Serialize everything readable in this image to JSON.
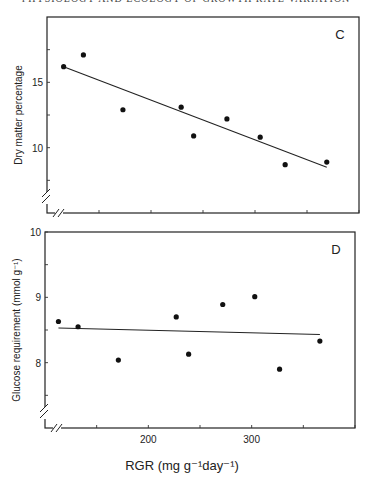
{
  "page": {
    "header": "PHYSIOLOGY AND ECOLOGY OF GROWTH RATE VARIATION"
  },
  "chart_data": [
    {
      "type": "scatter",
      "panel_label": "C",
      "title": "",
      "xlabel": "RGR (mg g⁻¹day⁻¹)",
      "ylabel": "Dry matter percentage",
      "xlim": [
        100,
        400
      ],
      "ylim": [
        5,
        20
      ],
      "axis_break": {
        "x": true,
        "y": true
      },
      "grid": false,
      "x_ticks": [
        150,
        200,
        250,
        300,
        350,
        400
      ],
      "x_tick_labels": [],
      "y_ticks": [
        7.5,
        10,
        12.5,
        15,
        17.5
      ],
      "y_tick_labels": [
        {
          "value": 10,
          "label": "10"
        },
        {
          "value": 15,
          "label": "15"
        }
      ],
      "points": [
        {
          "x": 116,
          "y": 16.2
        },
        {
          "x": 135,
          "y": 17.1
        },
        {
          "x": 173,
          "y": 12.9
        },
        {
          "x": 229,
          "y": 13.1
        },
        {
          "x": 241,
          "y": 10.9
        },
        {
          "x": 273,
          "y": 12.2
        },
        {
          "x": 305,
          "y": 10.8
        },
        {
          "x": 329,
          "y": 8.7
        },
        {
          "x": 369,
          "y": 8.9
        }
      ],
      "fit_line": {
        "x1": 116,
        "y1": 16.2,
        "x2": 369,
        "y2": 8.5
      }
    },
    {
      "type": "scatter",
      "panel_label": "D",
      "title": "",
      "xlabel": "RGR (mg g⁻¹day⁻¹)",
      "ylabel": "Glucose requirement (mmol  g⁻¹)",
      "xlim": [
        100,
        400
      ],
      "ylim": [
        7,
        10
      ],
      "axis_break": {
        "x": true,
        "y": true
      },
      "grid": false,
      "x_ticks": [
        150,
        200,
        250,
        300,
        350,
        400
      ],
      "x_tick_labels": [
        {
          "value": 200,
          "label": "200"
        },
        {
          "value": 300,
          "label": "300"
        }
      ],
      "y_ticks": [
        7.5,
        8,
        8.5,
        9,
        9.5,
        10
      ],
      "y_tick_labels": [
        {
          "value": 8,
          "label": "8"
        },
        {
          "value": 9,
          "label": "9"
        },
        {
          "value": 10,
          "label": "10"
        }
      ],
      "points": [
        {
          "x": 113,
          "y": 8.63
        },
        {
          "x": 132,
          "y": 8.55
        },
        {
          "x": 171,
          "y": 8.04
        },
        {
          "x": 227,
          "y": 8.7
        },
        {
          "x": 239,
          "y": 8.13
        },
        {
          "x": 272,
          "y": 8.89
        },
        {
          "x": 303,
          "y": 9.01
        },
        {
          "x": 327,
          "y": 7.9
        },
        {
          "x": 366,
          "y": 8.33
        }
      ],
      "fit_line": {
        "x1": 113,
        "y1": 8.53,
        "x2": 366,
        "y2": 8.43
      }
    }
  ]
}
